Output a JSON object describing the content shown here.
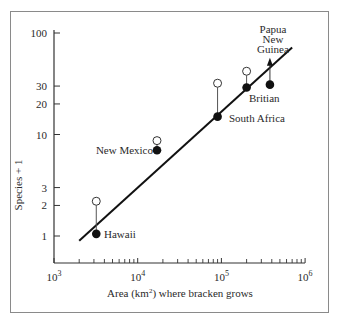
{
  "chart_data": {
    "type": "scatter",
    "title": "",
    "xlabel": "Area (km²) where bracken grows",
    "xlabel_parts": {
      "pre": "Area (km",
      "sup": "2",
      "post": ") where bracken grows"
    },
    "ylabel": "Species + 1",
    "xscale": "log",
    "yscale": "log",
    "xlim": [
      1000,
      1000000
    ],
    "ylim": [
      0.6,
      100
    ],
    "x_ticks": [
      {
        "base": "10",
        "exp": "3",
        "value": 1000
      },
      {
        "base": "10",
        "exp": "4",
        "value": 10000
      },
      {
        "base": "10",
        "exp": "5",
        "value": 100000
      },
      {
        "base": "10",
        "exp": "6",
        "value": 1000000
      }
    ],
    "y_ticks": [
      {
        "label": "1",
        "value": 1
      },
      {
        "label": "2",
        "value": 2
      },
      {
        "label": "3",
        "value": 3
      },
      {
        "label": "10",
        "value": 10
      },
      {
        "label": "20",
        "value": 20
      },
      {
        "label": "30",
        "value": 30
      },
      {
        "label": "100",
        "value": 100
      }
    ],
    "grid": false,
    "legend": null,
    "series": [
      {
        "name": "observed (filled)",
        "marker": "filled-circle",
        "points": [
          {
            "label": "Hawaii",
            "x": 3200,
            "y": 1.05
          },
          {
            "label": "New Mexico",
            "x": 17000,
            "y": 7
          },
          {
            "label": "South Africa",
            "x": 90000,
            "y": 15
          },
          {
            "label": "Britian",
            "x": 200000,
            "y": 29
          },
          {
            "label": "Papua New Guinea",
            "x": 380000,
            "y": 31
          }
        ]
      },
      {
        "name": "expected (open)",
        "marker": "open-circle",
        "points": [
          {
            "label": "Hawaii",
            "x": 3200,
            "y": 2.2
          },
          {
            "label": "New Mexico",
            "x": 17000,
            "y": 8.7
          },
          {
            "label": "South Africa",
            "x": 90000,
            "y": 32
          },
          {
            "label": "Britian",
            "x": 200000,
            "y": 42
          }
        ]
      }
    ],
    "fit_line": {
      "x": [
        2000,
        700000
      ],
      "y": [
        0.9,
        72
      ]
    },
    "annotations": [
      {
        "text": "Hawaii",
        "target": "Hawaii"
      },
      {
        "text": "New Mexico",
        "target": "New Mexico"
      },
      {
        "text": "South Africa",
        "target": "South Africa"
      },
      {
        "text": "Britian",
        "target": "Britian"
      },
      {
        "text": "Papua New Guinea",
        "lines": [
          "Papua",
          "New",
          "Guinea"
        ],
        "target": "Papua New Guinea",
        "arrow": "up"
      }
    ]
  },
  "labels": {
    "hawaii": "Hawaii",
    "new_mexico": "New Mexico",
    "south_africa": "South Africa",
    "britian": "Britian",
    "png_1": "Papua",
    "png_2": "New",
    "png_3": "Guinea"
  }
}
